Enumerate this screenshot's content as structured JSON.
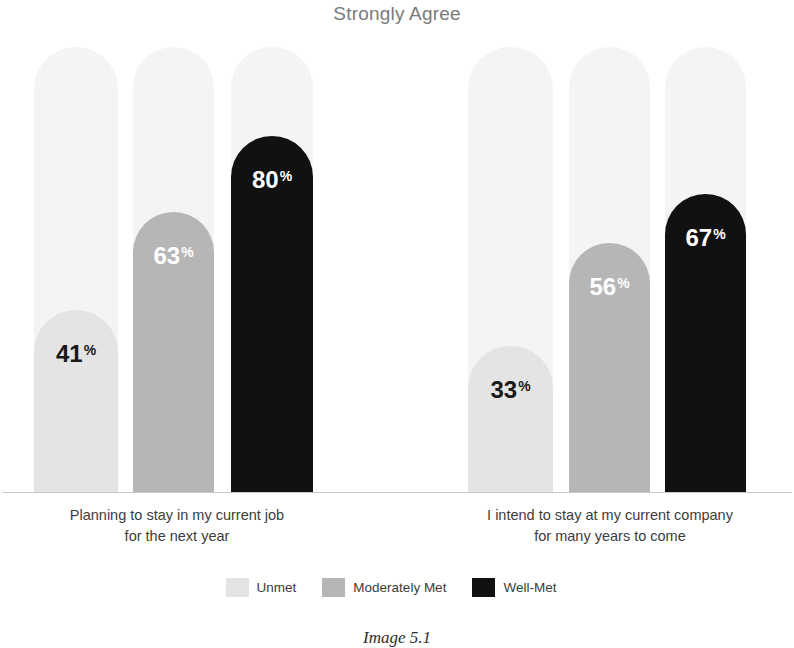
{
  "chart_data": {
    "type": "bar",
    "title": "Strongly Agree",
    "xlabel": "",
    "ylabel": "",
    "ylim": [
      0,
      100
    ],
    "grid": false,
    "legend_position": "bottom-center",
    "value_suffix": "%",
    "track_color": "#f4f4f4",
    "categories": [
      "Planning to stay in my current job for the next year",
      "I intend to stay at my current company for many years to come"
    ],
    "category_lines": [
      [
        "Planning to stay in my current job",
        "for the next year"
      ],
      [
        "I intend to stay at my current company",
        "for many years to come"
      ]
    ],
    "series": [
      {
        "name": "Unmet",
        "color": "#e4e4e4",
        "label_color": "#1a1a1a",
        "values": [
          41,
          33
        ]
      },
      {
        "name": "Moderately Met",
        "color": "#b6b6b6",
        "label_color": "#ffffff",
        "values": [
          63,
          56
        ]
      },
      {
        "name": "Well-Met",
        "color": "#111111",
        "label_color": "#ffffff",
        "values": [
          80,
          67
        ]
      }
    ],
    "data_labels": [
      {
        "group": 0,
        "series": "Unmet",
        "text": "41",
        "suffix": "%"
      },
      {
        "group": 0,
        "series": "Moderately Met",
        "text": "63",
        "suffix": "%"
      },
      {
        "group": 0,
        "series": "Well-Met",
        "text": "80",
        "suffix": "%"
      },
      {
        "group": 1,
        "series": "Unmet",
        "text": "33",
        "suffix": "%"
      },
      {
        "group": 1,
        "series": "Moderately Met",
        "text": "56",
        "suffix": "%"
      },
      {
        "group": 1,
        "series": "Well-Met",
        "text": "67",
        "suffix": "%"
      }
    ]
  },
  "title": "Strongly Agree",
  "legend": {
    "items": [
      {
        "label": "Unmet",
        "color": "#e4e4e4"
      },
      {
        "label": "Moderately Met",
        "color": "#b6b6b6"
      },
      {
        "label": "Well-Met",
        "color": "#111111"
      }
    ]
  },
  "caption": "Image 5.1",
  "values": {
    "g0s0": "41",
    "g0s1": "63",
    "g0s2": "80",
    "g1s0": "33",
    "g1s1": "56",
    "g1s2": "67"
  },
  "percent_sign": "%"
}
